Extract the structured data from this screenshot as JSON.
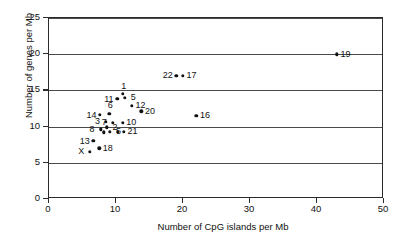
{
  "chart_data": {
    "type": "scatter",
    "title": "",
    "xlabel": "Number of CpG islands per Mb",
    "ylabel": "Number of genes per Mb",
    "xlim": [
      0,
      50
    ],
    "ylim": [
      0,
      25
    ],
    "xticks": [
      0,
      10,
      20,
      30,
      40,
      50
    ],
    "yticks": [
      0,
      5,
      10,
      15,
      20,
      25
    ],
    "grid": "horizontal",
    "legend": "none",
    "point_label_key": "chromosome",
    "points": [
      {
        "chromosome": "19",
        "x": 43.0,
        "y": 20.0,
        "label_pos": "right"
      },
      {
        "chromosome": "17",
        "x": 20.0,
        "y": 17.0,
        "label_pos": "right"
      },
      {
        "chromosome": "22",
        "x": 19.0,
        "y": 17.0,
        "label_pos": "left"
      },
      {
        "chromosome": "1",
        "x": 11.0,
        "y": 14.5,
        "label_pos": "above"
      },
      {
        "chromosome": "5",
        "x": 11.3,
        "y": 14.0,
        "label_pos": "right"
      },
      {
        "chromosome": "11",
        "x": 10.2,
        "y": 13.8,
        "label_pos": "left"
      },
      {
        "chromosome": "12",
        "x": 12.4,
        "y": 12.9,
        "label_pos": "right"
      },
      {
        "chromosome": "20",
        "x": 13.8,
        "y": 12.1,
        "label_pos": "right"
      },
      {
        "chromosome": "6",
        "x": 9.0,
        "y": 11.8,
        "label_pos": "above"
      },
      {
        "chromosome": "14",
        "x": 7.6,
        "y": 11.6,
        "label_pos": "left"
      },
      {
        "chromosome": "16",
        "x": 22.0,
        "y": 11.5,
        "label_pos": "right"
      },
      {
        "chromosome": "3",
        "x": 8.5,
        "y": 10.7,
        "label_pos": "left"
      },
      {
        "chromosome": "7",
        "x": 9.5,
        "y": 10.5,
        "label_pos": "left"
      },
      {
        "chromosome": "10",
        "x": 11.0,
        "y": 10.5,
        "label_pos": "right"
      },
      {
        "chromosome": "2",
        "x": 8.6,
        "y": 9.9,
        "label_pos": "right"
      },
      {
        "chromosome": "8",
        "x": 7.7,
        "y": 9.6,
        "label_pos": "left"
      },
      {
        "chromosome": "9",
        "x": 8.2,
        "y": 9.2,
        "label_pos": "none"
      },
      {
        "chromosome": "15",
        "x": 9.1,
        "y": 9.3,
        "label_pos": "none"
      },
      {
        "chromosome": "4",
        "x": 10.3,
        "y": 9.3,
        "label_pos": "none"
      },
      {
        "chromosome": "21",
        "x": 11.2,
        "y": 9.3,
        "label_pos": "right"
      },
      {
        "chromosome": "13",
        "x": 6.6,
        "y": 8.0,
        "label_pos": "left"
      },
      {
        "chromosome": "18",
        "x": 7.5,
        "y": 7.0,
        "label_pos": "right"
      },
      {
        "chromosome": "X",
        "x": 6.1,
        "y": 6.5,
        "label_pos": "left"
      }
    ],
    "extra_labels": [
      {
        "text": "5",
        "x": 9.1,
        "y": 9.3
      }
    ]
  },
  "axes": {
    "x_tick_labels": [
      "0",
      "10",
      "20",
      "30",
      "40",
      "50"
    ],
    "y_tick_labels": [
      "0",
      "5",
      "10",
      "15",
      "20",
      "25"
    ],
    "x_title": "Number of CpG islands per Mb",
    "y_title": "Number of genes per Mb"
  },
  "style": {
    "point_color": "#111111",
    "grid_color": "#4a4a4a",
    "frame_color": "#2b2b2b",
    "background": "#ffffff"
  }
}
